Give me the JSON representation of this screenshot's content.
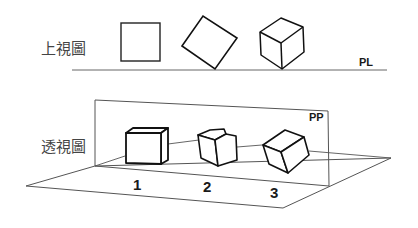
{
  "diagram": {
    "top_view": {
      "label": "上視圖",
      "ground_line_label": "PL",
      "shapes": [
        {
          "id": "square-front",
          "kind": "square"
        },
        {
          "id": "square-rotated",
          "kind": "rotated-square"
        },
        {
          "id": "cube-iso",
          "kind": "cube-corner-view"
        }
      ]
    },
    "perspective_view": {
      "label": "透視圖",
      "picture_plane_label": "PP",
      "cubes": [
        {
          "number": "1",
          "orientation": "parallel"
        },
        {
          "number": "2",
          "orientation": "angular"
        },
        {
          "number": "3",
          "orientation": "oblique"
        }
      ]
    },
    "colors": {
      "stroke": "#1a1a1a",
      "thin_stroke": "#555555",
      "background": "#ffffff"
    }
  }
}
